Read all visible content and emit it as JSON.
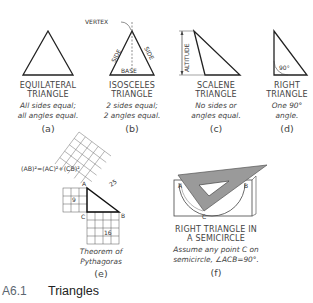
{
  "figure": {
    "number": "A6.1",
    "title": "Triangles"
  },
  "panels": [
    {
      "id": "a",
      "letter": "(a)",
      "name_lines": [
        "EQUILATERAL",
        "TRIANGLE"
      ],
      "desc_lines": [
        "All sides equal;",
        "all angles equal."
      ]
    },
    {
      "id": "b",
      "letter": "(b)",
      "name_lines": [
        "ISOSCELES",
        "TRIANGLE"
      ],
      "desc_lines": [
        "2 sides equal;",
        "2 angles equal."
      ],
      "labels": {
        "vertex": "VERTEX",
        "side_left": "SIDE",
        "side_right": "SIDE",
        "base": "BASE"
      }
    },
    {
      "id": "c",
      "letter": "(c)",
      "name_lines": [
        "SCALENE",
        "TRIANGLE"
      ],
      "desc_lines": [
        "No sides or",
        "angles equal."
      ],
      "labels": {
        "altitude": "ALTITUDE"
      }
    },
    {
      "id": "d",
      "letter": "(d)",
      "name_lines": [
        "RIGHT",
        "TRIANGLE"
      ],
      "desc_lines": [
        "One 90°",
        "angle."
      ],
      "labels": {
        "angle": "90°"
      }
    },
    {
      "id": "e",
      "letter": "(e)",
      "desc_lines": [
        "Theorem of",
        "Pythagoras"
      ],
      "labels": {
        "formula": "(AB)²=(AC)²+(CB)²",
        "a": "A",
        "b": "B",
        "c": "C",
        "sq_ac": "9",
        "sq_cb": "16",
        "sq_ab": "25"
      }
    },
    {
      "id": "f",
      "letter": "(f)",
      "name_lines": [
        "RIGHT TRIANGLE IN",
        "A SEMICIRCLE"
      ],
      "desc_lines": [
        "Assume any point C on",
        "semicircle, ∠ACB=90°."
      ],
      "labels": {
        "a": "A",
        "b": "B",
        "c": "C"
      }
    }
  ]
}
